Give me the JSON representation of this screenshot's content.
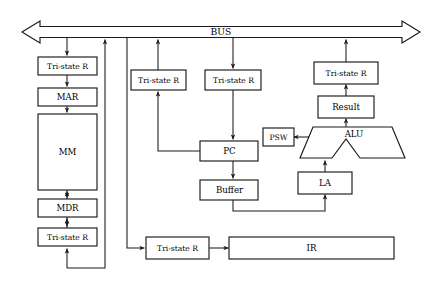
{
  "diagram": {
    "bus": {
      "label": "BUS",
      "direction": "bidirectional"
    },
    "blocks": {
      "tri_state_mar": {
        "label": "Tri-state R"
      },
      "mar": {
        "label": "MAR"
      },
      "mm": {
        "label": "MM"
      },
      "mdr": {
        "label": "MDR"
      },
      "tri_state_mdr": {
        "label": "Tri-state R"
      },
      "tri_state_pc_out": {
        "label": "Tri-state R"
      },
      "tri_state_pc_in": {
        "label": "Tri-state R"
      },
      "pc": {
        "label": "PC"
      },
      "buffer": {
        "label": "Buffer"
      },
      "tri_state_result": {
        "label": "Tri-state R"
      },
      "result": {
        "label": "Result"
      },
      "alu": {
        "label": "ALU"
      },
      "psw": {
        "label": "PSW"
      },
      "la": {
        "label": "LA"
      },
      "tri_state_ir": {
        "label": "Tri-state R"
      },
      "ir": {
        "label": "IR"
      }
    },
    "colors": {
      "stroke": "#1a1a1a",
      "fill": "#ffffff",
      "text": "#000000"
    }
  }
}
